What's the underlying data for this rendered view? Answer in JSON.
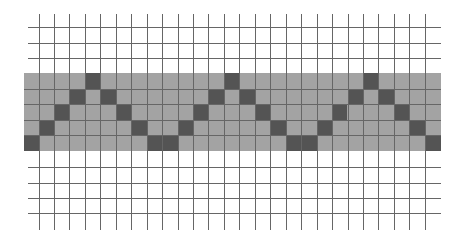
{
  "diagram": {
    "colors": {
      "background": "#ffffff",
      "grid_line": "#666666",
      "band_fill": "#a3a3a3",
      "dark_cell": "#545454"
    },
    "grid": {
      "origin_x": 24,
      "cell_size": 15.45,
      "columns": 27,
      "vertical_lines_x_start": 38.5,
      "vertical_line_count": 26,
      "vertical_line_top": 14,
      "vertical_line_bottom": 230,
      "horizontal_lines_y": [
        27,
        43,
        58,
        167,
        183,
        198,
        213
      ],
      "horizontal_line_left": 28,
      "horizontal_line_right": 441
    },
    "band": {
      "x": 24,
      "y": 73,
      "width": 417,
      "height": 78,
      "rows": 5,
      "row_lines_y": [
        88.5,
        104,
        119.5,
        135
      ]
    },
    "zigzag_period": 9,
    "dark_cells": [
      {
        "row": 4,
        "col": 0
      },
      {
        "row": 3,
        "col": 1
      },
      {
        "row": 2,
        "col": 2
      },
      {
        "row": 1,
        "col": 3
      },
      {
        "row": 0,
        "col": 4
      },
      {
        "row": 1,
        "col": 5
      },
      {
        "row": 2,
        "col": 6
      },
      {
        "row": 3,
        "col": 7
      },
      {
        "row": 4,
        "col": 8
      },
      {
        "row": 4,
        "col": 9
      },
      {
        "row": 3,
        "col": 10
      },
      {
        "row": 2,
        "col": 11
      },
      {
        "row": 1,
        "col": 12
      },
      {
        "row": 0,
        "col": 13
      },
      {
        "row": 1,
        "col": 14
      },
      {
        "row": 2,
        "col": 15
      },
      {
        "row": 3,
        "col": 16
      },
      {
        "row": 4,
        "col": 17
      },
      {
        "row": 4,
        "col": 18
      },
      {
        "row": 3,
        "col": 19
      },
      {
        "row": 2,
        "col": 20
      },
      {
        "row": 1,
        "col": 21
      },
      {
        "row": 0,
        "col": 22
      },
      {
        "row": 1,
        "col": 23
      },
      {
        "row": 2,
        "col": 24
      },
      {
        "row": 3,
        "col": 25
      },
      {
        "row": 4,
        "col": 26
      }
    ]
  }
}
